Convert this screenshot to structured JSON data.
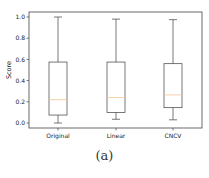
{
  "chart_data": {
    "type": "box",
    "title": "",
    "xlabel": "",
    "ylabel": "Score",
    "ylim": [
      -0.03,
      1.05
    ],
    "yticks": [
      0.0,
      0.2,
      0.4,
      0.6,
      0.8,
      1.0
    ],
    "ytick_labels": [
      "0.0",
      "0.2",
      "0.4",
      "0.6",
      "0.8",
      "1.0"
    ],
    "grid": false,
    "legend": null,
    "categories": [
      "Original",
      "Linear",
      "CNCV"
    ],
    "series": [
      {
        "name": "Original",
        "whisker_low": 0.0,
        "q1": 0.075,
        "median": 0.22,
        "q3": 0.575,
        "whisker_high": 1.0
      },
      {
        "name": "Linear",
        "whisker_low": 0.035,
        "q1": 0.1,
        "median": 0.24,
        "q3": 0.575,
        "whisker_high": 0.98
      },
      {
        "name": "CNCV",
        "whisker_low": 0.03,
        "q1": 0.145,
        "median": 0.265,
        "q3": 0.56,
        "whisker_high": 0.975
      }
    ],
    "colors": {
      "box": "#555555",
      "median": "#f5c9a0",
      "frame": "#444444"
    }
  },
  "caption": "(a)"
}
